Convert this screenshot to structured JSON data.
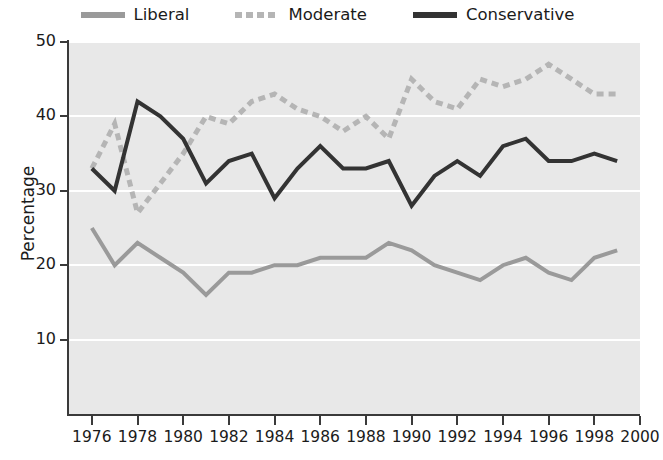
{
  "legend": {
    "position": "top-center",
    "items": [
      {
        "label": "Liberal",
        "color": "#9a9a9a",
        "style": "solid"
      },
      {
        "label": "Moderate",
        "color": "#b5b5b5",
        "style": "dashed"
      },
      {
        "label": "Conservative",
        "color": "#333333",
        "style": "solid"
      }
    ]
  },
  "axes": {
    "ylabel": "Percentage",
    "xlabel": "",
    "yticks": [
      10,
      20,
      30,
      40,
      50
    ],
    "xticks": [
      1976,
      1978,
      1980,
      1982,
      1984,
      1986,
      1988,
      1990,
      1992,
      1994,
      1996,
      1998,
      2000
    ]
  },
  "style": {
    "plot_background": "#e8e8e8",
    "gridline_color": "#ffffff",
    "axis_color": "#3a3a3a",
    "text_color": "#1b1b1b"
  },
  "chart_data": {
    "type": "line",
    "title": "",
    "xlabel": "",
    "ylabel": "Percentage",
    "xlim": [
      1975,
      2000
    ],
    "ylim": [
      0,
      50
    ],
    "grid": "horizontal",
    "legend_position": "top-center",
    "x": [
      1976,
      1977,
      1978,
      1979,
      1980,
      1981,
      1982,
      1983,
      1984,
      1985,
      1986,
      1987,
      1988,
      1989,
      1990,
      1991,
      1992,
      1993,
      1994,
      1995,
      1996,
      1997,
      1998,
      1999
    ],
    "series": [
      {
        "name": "Liberal",
        "color": "#9a9a9a",
        "style": "solid",
        "values": [
          25,
          20,
          23,
          21,
          19,
          16,
          19,
          19,
          20,
          20,
          21,
          21,
          21,
          23,
          22,
          20,
          19,
          18,
          20,
          21,
          19,
          18,
          21,
          22
        ]
      },
      {
        "name": "Moderate",
        "color": "#b5b5b5",
        "style": "dashed",
        "values": [
          33,
          39,
          27,
          31,
          35,
          40,
          39,
          42,
          43,
          41,
          40,
          38,
          40,
          37,
          45,
          42,
          41,
          45,
          44,
          45,
          47,
          45,
          43,
          43
        ]
      },
      {
        "name": "Conservative",
        "color": "#333333",
        "style": "solid",
        "values": [
          33,
          30,
          42,
          40,
          37,
          31,
          34,
          35,
          29,
          33,
          36,
          33,
          33,
          34,
          28,
          32,
          34,
          32,
          36,
          37,
          34,
          34,
          35,
          34
        ]
      }
    ]
  }
}
